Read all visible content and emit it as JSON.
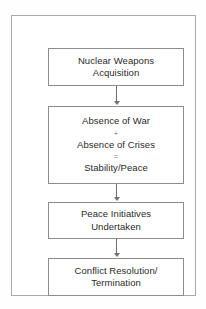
{
  "diagram": {
    "title": "",
    "background_color": "#ffffff",
    "frame_border_color": "#a9a9a9",
    "node_border_color": "#8d8d8d",
    "text_color": "#2b2b2b",
    "connector_color": "#6f6f6f",
    "nodes": [
      {
        "id": "nuclear-weapons-acquisition",
        "lines": [
          {
            "text": "Nuclear Weapons",
            "style": "normal"
          },
          {
            "text": "Acquisition",
            "style": "normal"
          }
        ]
      },
      {
        "id": "stability-peace",
        "lines": [
          {
            "text": "Absence of War",
            "style": "normal"
          },
          {
            "text": "+",
            "style": "operator"
          },
          {
            "text": "Absence of Crises",
            "style": "normal"
          },
          {
            "text": "=",
            "style": "operator"
          },
          {
            "text": "Stability/Peace",
            "style": "normal"
          }
        ]
      },
      {
        "id": "peace-initiatives-undertaken",
        "lines": [
          {
            "text": "Peace Initiatives",
            "style": "normal"
          },
          {
            "text": "Undertaken",
            "style": "normal"
          }
        ]
      },
      {
        "id": "conflict-resolution-termination",
        "lines": [
          {
            "text": "Conflict Resolution/",
            "style": "normal"
          },
          {
            "text": "Termination",
            "style": "normal"
          }
        ]
      }
    ],
    "connectors": [
      {
        "id": "arrow-1",
        "from": "nuclear-weapons-acquisition",
        "to": "stability-peace",
        "direction": "down"
      },
      {
        "id": "arrow-2",
        "from": "stability-peace",
        "to": "peace-initiatives-undertaken",
        "direction": "down"
      },
      {
        "id": "arrow-3",
        "from": "peace-initiatives-undertaken",
        "to": "conflict-resolution-termination",
        "direction": "down"
      }
    ]
  }
}
